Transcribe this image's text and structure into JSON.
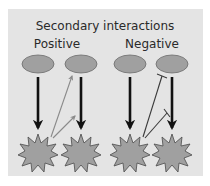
{
  "diagram": {
    "title": "Secondary interactions",
    "groups": [
      {
        "label": "Positive",
        "interaction": "activation",
        "color": "#8a8a8a"
      },
      {
        "label": "Negative",
        "interaction": "inhibition",
        "color": "#3a3a3a"
      }
    ],
    "nodes": {
      "regulator_shape": "ellipse",
      "target_shape": "starburst",
      "regulator_fill": "#a0a0a0",
      "target_fill": "#a0a0a0",
      "count_per_group": 2
    },
    "edges": {
      "primary": "thick black arrow from each ellipse to the starburst below",
      "secondary_positive": "thin gray arrows from left starburst to right ellipse and right primary arrow",
      "secondary_negative": "thin dark T-bar lines from left starburst to right ellipse and right primary arrow"
    },
    "colors": {
      "background": "#e4e4e4",
      "primary_arrow": "#111111",
      "positive_arrow": "#8a8a8a",
      "negative_line": "#3a3a3a"
    }
  }
}
